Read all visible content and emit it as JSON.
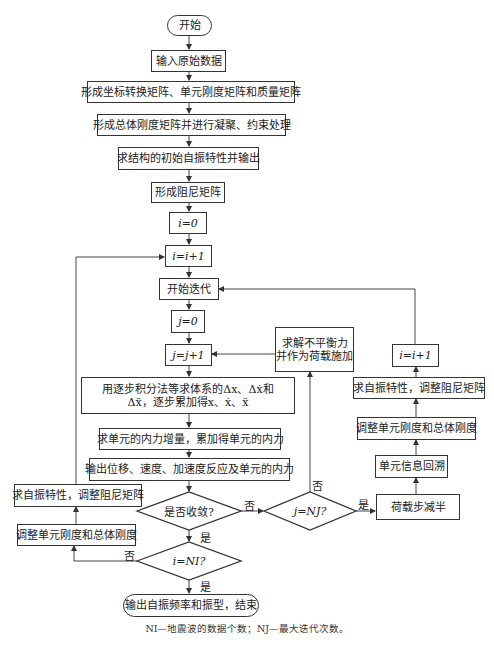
{
  "flowchart": {
    "start": "开始",
    "input": "输入原始数据",
    "form_matrices": "形成坐标转换矩阵、单元刚度矩阵和质量矩阵",
    "global_stiffness": "形成总体刚度矩阵并进行凝聚、约束处理",
    "initial_vibration": "求结构的初始自振特性并输出",
    "damping": "形成阻尼矩阵",
    "i_init": "i=0",
    "i_inc": "i=i+1",
    "iter_start": "开始迭代",
    "j_init": "j=0",
    "j_inc": "j=j+1",
    "integrate_line1": "用逐步积分法等求体系的Δx、Δẋ和",
    "integrate_line2": "Δẍ，逐步累加得x、ẋ、ẍ",
    "internal_force": "求单元的内力增量，累加得单元的内力",
    "output_response": "输出位移、速度、加速度反应及单元的内力",
    "converged_q": "是否收敛?",
    "j_nj_q": "j=NJ?",
    "i_ni_q": "i=NI?",
    "unbalanced_line1": "求解不平衡力",
    "unbalanced_line2": "并作为荷载施加",
    "right_i_inc": "i=i+1",
    "right_vibration": "求自振特性，调整阻尼矩阵",
    "right_stiffness": "调整单元刚度和总体刚度",
    "backtrack": "单元信息回溯",
    "halve_load": "荷载步减半",
    "left_vibration": "求自振特性，调整阻尼矩阵",
    "left_stiffness": "调整单元刚度和总体刚度",
    "end": "输出自振频率和振型，结束",
    "labels": {
      "no_converge": "否",
      "yes_converge": "是",
      "no_nj": "否",
      "yes_nj": "是",
      "no_ni": "否",
      "yes_ni": "是"
    }
  },
  "footnote": "NI—地震波的数据个数；NJ—最大迭代次数。"
}
